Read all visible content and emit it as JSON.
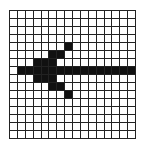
{
  "grid": {
    "rows": 16,
    "cols": 16,
    "fill_color": "#111111",
    "line_color": "#222222",
    "filled_cells": [
      [
        4,
        7
      ],
      [
        5,
        5
      ],
      [
        5,
        6
      ],
      [
        6,
        3
      ],
      [
        6,
        4
      ],
      [
        6,
        5
      ],
      [
        7,
        1
      ],
      [
        7,
        2
      ],
      [
        7,
        3
      ],
      [
        7,
        4
      ],
      [
        7,
        5
      ],
      [
        7,
        6
      ],
      [
        7,
        7
      ],
      [
        7,
        8
      ],
      [
        7,
        9
      ],
      [
        7,
        10
      ],
      [
        7,
        11
      ],
      [
        7,
        12
      ],
      [
        7,
        13
      ],
      [
        7,
        14
      ],
      [
        7,
        15
      ],
      [
        8,
        3
      ],
      [
        8,
        4
      ],
      [
        8,
        5
      ],
      [
        9,
        5
      ],
      [
        9,
        6
      ],
      [
        10,
        7
      ]
    ],
    "shape": "arrow-left"
  }
}
